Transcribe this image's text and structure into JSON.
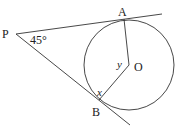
{
  "diagram": {
    "type": "circle-tangents",
    "points": {
      "P": {
        "label": "P"
      },
      "A": {
        "label": "A"
      },
      "B": {
        "label": "B"
      },
      "O": {
        "label": "O"
      }
    },
    "angles": {
      "at_P": "45°",
      "at_B": "x",
      "at_O": "y"
    },
    "colors": {
      "stroke": "#333333",
      "text": "#222222"
    }
  }
}
